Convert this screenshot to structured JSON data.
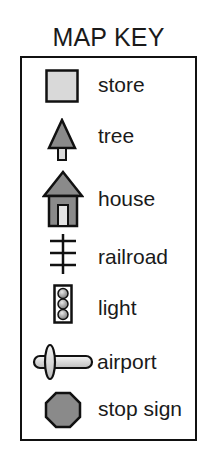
{
  "title": "MAP KEY",
  "colors": {
    "outline": "#111111",
    "light_fill": "#d9d9d9",
    "dark_fill": "#8a8a8a",
    "door_fill": "#e4e4e4"
  },
  "items": [
    {
      "icon": "store-icon",
      "label": "store"
    },
    {
      "icon": "tree-icon",
      "label": "tree"
    },
    {
      "icon": "house-icon",
      "label": "house"
    },
    {
      "icon": "railroad-icon",
      "label": "railroad"
    },
    {
      "icon": "light-icon",
      "label": "light"
    },
    {
      "icon": "airport-icon",
      "label": "airport"
    },
    {
      "icon": "stop-sign-icon",
      "label": "stop sign"
    }
  ]
}
